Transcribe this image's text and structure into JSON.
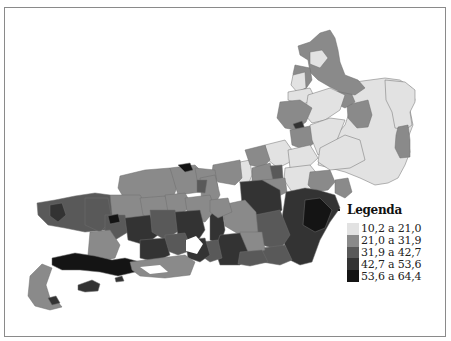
{
  "map": {
    "subject": "Rio de Janeiro state municipalities choropleth",
    "class_colors": [
      "#e2e2e2",
      "#8a8a8a",
      "#595959",
      "#333333",
      "#141414"
    ]
  },
  "legend": {
    "title": "Legenda",
    "items": [
      {
        "label": "10,2 a 21,0",
        "color": "#e2e2e2"
      },
      {
        "label": "21,0 a 31,9",
        "color": "#8a8a8a"
      },
      {
        "label": "31,9 a 42,7",
        "color": "#595959"
      },
      {
        "label": "42,7 a 53,6",
        "color": "#333333"
      },
      {
        "label": "53,6 a 64,4",
        "color": "#141414"
      }
    ]
  }
}
